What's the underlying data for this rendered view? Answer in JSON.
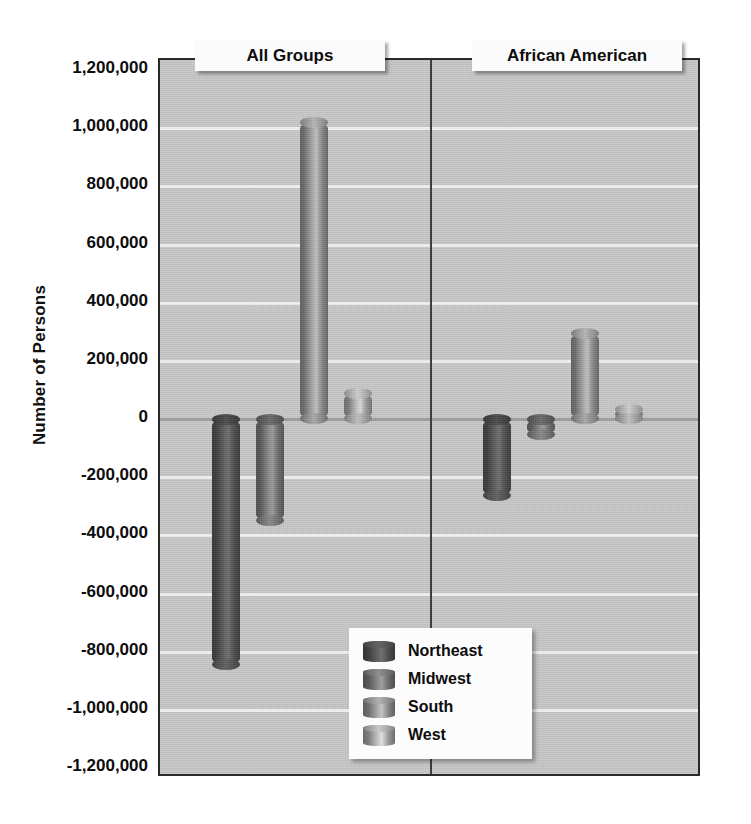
{
  "chart_data": {
    "type": "bar",
    "title": "",
    "xlabel": "",
    "ylabel": "Number of Persons",
    "ylim": [
      -1200000,
      1200000
    ],
    "ytick_step": 200000,
    "grid": true,
    "legend_position": "bottom-center",
    "panels": [
      "All Groups",
      "African American"
    ],
    "categories": [
      "Northeast",
      "Midwest",
      "South",
      "West"
    ],
    "series": [
      {
        "name": "All Groups",
        "values": [
          -845000,
          -350000,
          1020000,
          90000
        ]
      },
      {
        "name": "African American",
        "values": [
          -265000,
          -55000,
          295000,
          35000
        ]
      }
    ],
    "yticks": [
      "1,200,000",
      "1,000,000",
      "800,000",
      "600,000",
      "400,000",
      "200,000",
      "0",
      "-200,000",
      "-400,000",
      "-600,000",
      "-800,000",
      "-1,000,000",
      "-1,200,000"
    ],
    "ytick_values": [
      1200000,
      1000000,
      800000,
      600000,
      400000,
      200000,
      0,
      -200000,
      -400000,
      -600000,
      -800000,
      -1000000,
      -1200000
    ],
    "colors": {
      "Northeast": "#595959",
      "Midwest": "#7d7d7d",
      "South": "#9b9b9b",
      "West": "#b0b0b0",
      "plot_background": "#c8c8c8",
      "gridline": "#f4f4f4",
      "axis_border": "#2a2a2a",
      "page_background": "#ffffff"
    }
  },
  "axis": {
    "ylabel": "Number of Persons"
  },
  "panels": [
    {
      "label": "All Groups"
    },
    {
      "label": "African American"
    }
  ],
  "legend": {
    "items": [
      {
        "label": "Northeast"
      },
      {
        "label": "Midwest"
      },
      {
        "label": "South"
      },
      {
        "label": "West"
      }
    ]
  }
}
